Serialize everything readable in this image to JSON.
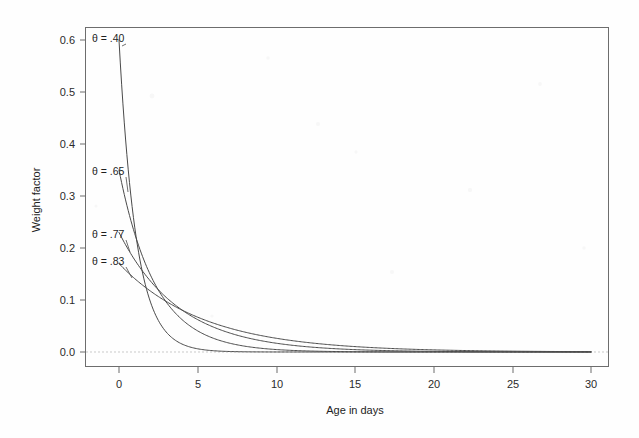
{
  "chart_data": {
    "type": "line",
    "title": "",
    "xlabel": "Age in days",
    "ylabel": "Weight factor",
    "xlim": [
      -1.2,
      30.5
    ],
    "ylim": [
      -0.02,
      0.645
    ],
    "xticks": [
      0,
      5,
      10,
      15,
      20,
      25,
      30
    ],
    "xticklabels": [
      "0",
      "5",
      "10",
      "15",
      "20",
      "25",
      "30"
    ],
    "yticks": [
      0.0,
      0.1,
      0.2,
      0.3,
      0.4,
      0.5,
      0.6
    ],
    "yticklabels": [
      "0.0",
      "0.1",
      "0.2",
      "0.3",
      "0.4",
      "0.5",
      "0.6"
    ],
    "grid": false,
    "legend_position": "inline-annotations",
    "reference_lines": [
      {
        "axis": "y",
        "value": 0.0,
        "style": "dashed"
      }
    ],
    "x": [
      0,
      1,
      2,
      3,
      4,
      5,
      6,
      7,
      8,
      9,
      10,
      11,
      12,
      13,
      14,
      15,
      16,
      17,
      18,
      19,
      20,
      21,
      22,
      23,
      24,
      25,
      26,
      27,
      28,
      29,
      30
    ],
    "series": [
      {
        "name": "theta = .40",
        "label": "θ = .40",
        "theta": 0.4,
        "values": [
          0.6,
          0.24,
          0.096,
          0.0384,
          0.0154,
          0.0061,
          0.0025,
          0.001,
          0.0004,
          0.0002,
          0.0001,
          0.0,
          0.0,
          0.0,
          0.0,
          0.0,
          0.0,
          0.0,
          0.0,
          0.0,
          0.0,
          0.0,
          0.0,
          0.0,
          0.0,
          0.0,
          0.0,
          0.0,
          0.0,
          0.0,
          0.0
        ]
      },
      {
        "name": "theta = .65",
        "label": "θ = .65",
        "theta": 0.65,
        "values": [
          0.35,
          0.2275,
          0.1479,
          0.0961,
          0.0625,
          0.0406,
          0.0264,
          0.0172,
          0.0112,
          0.0073,
          0.0047,
          0.0031,
          0.002,
          0.0013,
          0.0008,
          0.0005,
          0.0004,
          0.0002,
          0.0002,
          0.0001,
          0.0001,
          0.0,
          0.0,
          0.0,
          0.0,
          0.0,
          0.0,
          0.0,
          0.0,
          0.0,
          0.0
        ]
      },
      {
        "name": "theta = .77",
        "label": "θ = .77",
        "theta": 0.77,
        "values": [
          0.23,
          0.1771,
          0.1364,
          0.105,
          0.0809,
          0.0623,
          0.048,
          0.0369,
          0.0284,
          0.0219,
          0.0169,
          0.013,
          0.01,
          0.0077,
          0.0059,
          0.0046,
          0.0035,
          0.0027,
          0.0021,
          0.0016,
          0.0012,
          0.0009,
          0.0007,
          0.0006,
          0.0004,
          0.0003,
          0.0003,
          0.0002,
          0.0002,
          0.0001,
          0.0001
        ]
      },
      {
        "name": "theta = .83",
        "label": "θ = .83",
        "theta": 0.83,
        "values": [
          0.17,
          0.1411,
          0.1171,
          0.0972,
          0.0807,
          0.067,
          0.0556,
          0.0461,
          0.0383,
          0.0318,
          0.0264,
          0.0219,
          0.0182,
          0.0151,
          0.0125,
          0.0104,
          0.0086,
          0.0072,
          0.0059,
          0.0049,
          0.0041,
          0.0034,
          0.0028,
          0.0024,
          0.002,
          0.0016,
          0.0014,
          0.0011,
          0.0009,
          0.0008,
          0.0006
        ]
      }
    ],
    "annotations": [
      {
        "text": "θ = .40",
        "x_px": 92,
        "y_px": 42,
        "leader_to_x_px": 122,
        "leader_to_y_px": 46
      },
      {
        "text": "θ = .65",
        "x_px": 92,
        "y_px": 175,
        "leader_to_x_px": 128,
        "leader_to_y_px": 192
      },
      {
        "text": "θ = .77",
        "x_px": 92,
        "y_px": 238,
        "leader_to_x_px": 130,
        "leader_to_y_px": 252
      },
      {
        "text": "θ = .83",
        "x_px": 92,
        "y_px": 265,
        "leader_to_x_px": 132,
        "leader_to_y_px": 278
      }
    ]
  },
  "axes": {
    "x_title": "Age in days",
    "y_title": "Weight factor"
  }
}
